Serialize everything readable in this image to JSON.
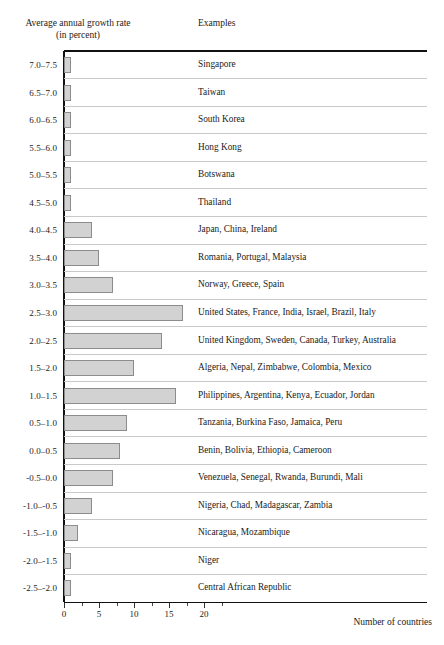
{
  "header": {
    "growth_title_line1": "Average annual growth rate",
    "growth_title_line2": "(in percent)",
    "examples_title": "Examples"
  },
  "axis": {
    "x_title": "Number of countries",
    "tick_labels": [
      "0",
      "5",
      "10",
      "15",
      "20"
    ],
    "tick_values": [
      0,
      5,
      10,
      15,
      20
    ],
    "minor_tick_values": [
      2.5,
      7.5,
      12.5,
      17.5,
      22.5
    ],
    "xmin": 0,
    "xmax": 22.5
  },
  "style": {
    "bar_fill": "#d2d2d2",
    "bar_border": "#8c8c8c",
    "rule_color": "#c9c9c9",
    "axis_color": "#111111"
  },
  "chart_data": {
    "type": "bar",
    "orientation": "horizontal",
    "title": "",
    "xlabel": "Number of countries",
    "ylabel": "Average annual growth rate (in percent)",
    "xlim": [
      0,
      22.5
    ],
    "grid": false,
    "legend": "none",
    "categories": [
      "7.0–7.5",
      "6.5–7.0",
      "6.0–6.5",
      "5.5–6.0",
      "5.0–5.5",
      "4.5–5.0",
      "4.0–4.5",
      "3.5–4.0",
      "3.0–3.5",
      "2.5–3.0",
      "2.0–2.5",
      "1.5–2.0",
      "1.0–1.5",
      "0.5–1.0",
      "0.0–0.5",
      "-0.5–0.0",
      "-1.0–-0.5",
      "-1.5–-1.0",
      "-2.0–-1.5",
      "-2.5–-2.0"
    ],
    "values": [
      1,
      1,
      1,
      1,
      1,
      1,
      4,
      5,
      7,
      17,
      14,
      10,
      16,
      9,
      8,
      7,
      4,
      2,
      1,
      1
    ],
    "annotations": [
      "Singapore",
      "Taiwan",
      "South Korea",
      "Hong Kong",
      "Botswana",
      "Thailand",
      "Japan, China, Ireland",
      "Romania, Portugal, Malaysia",
      "Norway, Greece, Spain",
      "United States, France, India, Israel, Brazil, Italy",
      "United Kingdom, Sweden, Canada, Turkey, Australia",
      "Algeria, Nepal, Zimbabwe, Colombia, Mexico",
      "Philippines, Argentina, Kenya, Ecuador, Jordan",
      "Tanzania, Burkina Faso, Jamaica, Peru",
      "Benin, Bolivia, Ethiopia, Cameroon",
      "Venezuela, Senegal, Rwanda, Burundi, Mali",
      "Nigeria, Chad, Madagascar, Zambia",
      "Nicaragua, Mozambique",
      "Niger",
      "Central African Republic"
    ]
  }
}
